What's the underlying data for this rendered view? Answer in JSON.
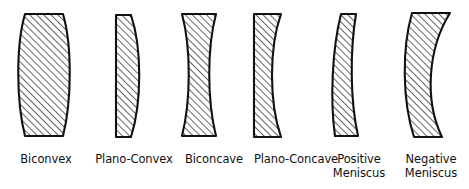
{
  "figure": {
    "background_color": "#ffffff",
    "outline_color": "#111111",
    "hatch_color": "#555555",
    "label_color": "#111111"
  },
  "lenses": [
    {
      "id": "biconvex",
      "label": "Biconvex",
      "description": "Both surfaces convex, thick in the middle, flat top and bottom edges",
      "left_surface": "convex",
      "right_surface": "convex",
      "label_x": 6,
      "label_width": 80,
      "label_y": 152,
      "path": "M 25.0 14.0 L 63.0 14.0 C 72.0 45.0 72.0 100.0 63.0 136.0 L 25.0 136.0 C 16.0 100.0 16.0 45.0 25.0 14.0 Z"
    },
    {
      "id": "plano-convex",
      "label": "Plano-Convex",
      "description": "Flat left surface, convex right surface",
      "left_surface": "plano",
      "right_surface": "convex",
      "label_x": 88,
      "label_width": 92,
      "label_y": 152,
      "path": "M 116.0 15.0 L 131.0 15.0 C 142.0 48.0 142.0 102.0 131.0 137.0 L 116.0 137.0 Z"
    },
    {
      "id": "biconcave",
      "label": "Biconcave",
      "description": "Both surfaces concave, hourglass profile, thin in the middle",
      "left_surface": "concave",
      "right_surface": "concave",
      "label_x": 174,
      "label_width": 80,
      "label_y": 152,
      "path": "M 182.0 14.0 L 216.0 14.0 C 207.0 48.0 207.0 100.0 216.0 136.0 L 182.0 136.0 C 191.0 100.0 191.0 48.0 182.0 14.0 Z"
    },
    {
      "id": "plano-concave",
      "label": "Plano-Concave",
      "description": "Flat left surface, concave right surface",
      "left_surface": "plano",
      "right_surface": "concave",
      "label_x": 246,
      "label_width": 100,
      "label_y": 152,
      "path": "M 254.0 14.0 L 281.0 14.0 C 269.0 48.0 269.0 102.0 281.0 137.0 L 254.0 137.0 Z"
    },
    {
      "id": "positive-meniscus",
      "label": "Positive\nMeniscus",
      "description": "Crescent shape, convex and concave surfaces, thicker at the centre",
      "left_surface": "convex",
      "right_surface": "concave",
      "label_x": 326,
      "label_width": 66,
      "label_y": 152,
      "path": "M 341.0 14.0 L 356.0 14.0 C 350.0 50.0 350.0 100.0 358.0 136.0 L 335.0 136.0 C 330.0 100.0 332.0 50.0 341.0 14.0 Z"
    },
    {
      "id": "negative-meniscus",
      "label": "Negative\nMeniscus",
      "description": "Strong crescent shape, thinner at the centre than at the edges",
      "left_surface": "convex",
      "right_surface": "concave",
      "label_x": 396,
      "label_width": 70,
      "label_y": 152,
      "path": "M 412.0 13.0 L 450.0 13.0 C 428.0 48.0 424.0 100.0 442.0 137.0 L 414.0 137.0 C 402.0 100.0 402.0 48.0 412.0 13.0 Z"
    }
  ]
}
